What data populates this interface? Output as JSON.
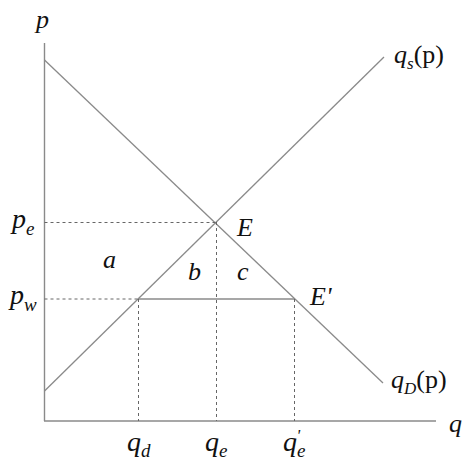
{
  "diagram": {
    "type": "supply-demand",
    "axes": {
      "y_label": "p",
      "x_label": "q"
    },
    "curves": {
      "supply": {
        "label_main": "q",
        "label_sub": "s",
        "label_tail": "(p)"
      },
      "demand": {
        "label_main": "q",
        "label_sub": "D",
        "label_tail": "(p)"
      }
    },
    "price_labels": {
      "pe": {
        "main": "p",
        "sub": "e"
      },
      "pw": {
        "main": "p",
        "sub": "w"
      }
    },
    "quantity_labels": {
      "qd": {
        "main": "q",
        "sub": "d"
      },
      "qe": {
        "main": "q",
        "sub": "e"
      },
      "qe_prime": {
        "main": "q",
        "sub": "e",
        "prime": "'"
      }
    },
    "points": {
      "E": "E",
      "E_prime": "E'"
    },
    "regions": {
      "a": "a",
      "b": "b",
      "c": "c"
    },
    "colors": {
      "lines": "#8a8a8a",
      "dashed": "#666666",
      "text": "#111111"
    }
  }
}
